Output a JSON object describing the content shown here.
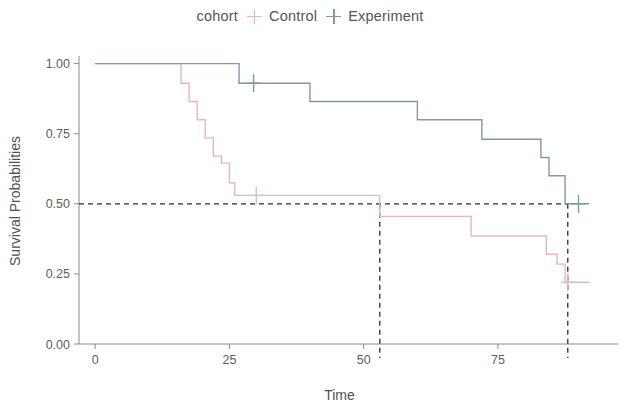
{
  "legend": {
    "title": "cohort",
    "items": [
      {
        "label": "Control",
        "color": "#e8b6bd",
        "glyph": "plus-marker"
      },
      {
        "label": "Experiment",
        "color": "#7f9aa3",
        "glyph": "plus-marker"
      }
    ]
  },
  "axes": {
    "x": {
      "title": "Time",
      "ticks": [
        "0",
        "25",
        "50",
        "75"
      ],
      "tick_values": [
        0,
        25,
        50,
        75
      ],
      "range": [
        -3,
        94
      ]
    },
    "y": {
      "title": "Survival Probabilities",
      "ticks": [
        "1.00",
        "0.75",
        "0.50",
        "0.25",
        "0.00"
      ],
      "tick_values": [
        1.0,
        0.75,
        0.5,
        0.25,
        0.0
      ],
      "range": [
        0,
        1.02
      ]
    }
  },
  "chart_data": {
    "type": "line",
    "subtype": "kaplan-meier-step",
    "title": "",
    "xlabel": "Time",
    "ylabel": "Survival Probabilities",
    "xlim": [
      -3,
      94
    ],
    "ylim": [
      0,
      1.02
    ],
    "grid": false,
    "legend_position": "top-center",
    "legend_title": "cohort",
    "series": [
      {
        "name": "Control",
        "color": "#e8b6bd",
        "step_type": "post",
        "x": [
          0,
          16,
          17.5,
          19,
          20.5,
          22,
          23.5,
          25,
          26,
          26.5,
          53,
          70,
          78,
          84,
          86,
          87.5,
          88
        ],
        "y": [
          1.0,
          0.93,
          0.865,
          0.8,
          0.735,
          0.67,
          0.645,
          0.575,
          0.53,
          0.53,
          0.455,
          0.385,
          0.385,
          0.32,
          0.285,
          0.22,
          0.22
        ],
        "censor_marks": [
          {
            "x": 30,
            "y": 0.53
          },
          {
            "x": 88,
            "y": 0.22
          }
        ]
      },
      {
        "name": "Experiment",
        "color": "#7f9aa3",
        "step_type": "post",
        "x": [
          0,
          26.8,
          40,
          60,
          72,
          83,
          84.5,
          87.5,
          88
        ],
        "y": [
          1.0,
          0.93,
          0.865,
          0.8,
          0.73,
          0.665,
          0.6,
          0.5,
          0.5
        ],
        "censor_marks": [
          {
            "x": 29.5,
            "y": 0.93
          },
          {
            "x": 90,
            "y": 0.5
          }
        ]
      }
    ],
    "reference_lines": [
      {
        "orientation": "horizontal",
        "value": 0.5,
        "style": "dashed",
        "color": "#2b2b2b"
      },
      {
        "orientation": "vertical",
        "value": 53,
        "style": "dashed",
        "color": "#2b2b2b"
      },
      {
        "orientation": "vertical",
        "value": 88,
        "style": "dashed",
        "color": "#2b2b2b"
      }
    ],
    "annotations": [
      {
        "text": "median survival Control",
        "x": 53,
        "y": 0.5
      },
      {
        "text": "median survival Experiment",
        "x": 88,
        "y": 0.5
      }
    ]
  }
}
